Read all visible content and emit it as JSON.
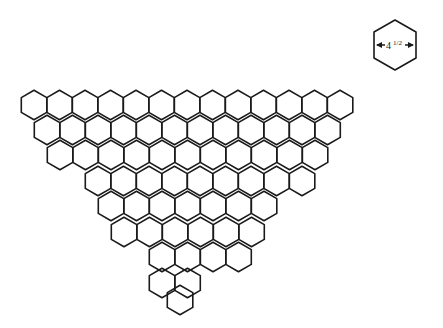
{
  "diagram": {
    "type": "hexagon-quilt-pattern",
    "shape": "inverted triangle of hexagons",
    "stroke_color": "#1a1a1a",
    "hex_size": {
      "width": 25.5,
      "row_spacing": 25.3
    },
    "rows": [
      {
        "y": 105,
        "x_start": 34,
        "count": 13
      },
      {
        "y": 130,
        "x_start": 47,
        "count": 12
      },
      {
        "y": 155,
        "x_start": 60,
        "count": 11
      },
      {
        "y": 181,
        "x_start": 98,
        "count": 9
      },
      {
        "y": 206,
        "x_start": 111,
        "count": 7
      },
      {
        "y": 232,
        "x_start": 124,
        "count": 6
      },
      {
        "y": 257,
        "x_start": 162,
        "count": 4
      },
      {
        "y": 283,
        "x_start": 162,
        "count": 2
      },
      {
        "y": 300,
        "x_start": 180,
        "count": 1
      }
    ]
  },
  "legend": {
    "dimension_label": "4½″",
    "dimension_text": "4",
    "fraction_text": "1/2",
    "inch_mark": "″"
  }
}
